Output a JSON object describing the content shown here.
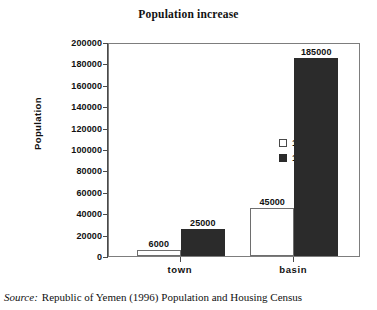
{
  "chart_data": {
    "type": "bar",
    "title": "Population increase",
    "xlabel": "",
    "ylabel": "Population",
    "categories": [
      "town",
      "basin"
    ],
    "series": [
      {
        "name": "1975",
        "values": [
          6000,
          45000
        ],
        "color": "#ffffff"
      },
      {
        "name": "1994",
        "values": [
          25000,
          185000
        ],
        "color": "#2b2b2b"
      }
    ],
    "ylim": [
      0,
      200000
    ],
    "ytick_step": 20000,
    "yticks": [
      "200000",
      "180000",
      "160000",
      "140000",
      "120000",
      "100000",
      "80000",
      "60000",
      "40000",
      "20000",
      "0"
    ],
    "data_labels": {
      "town": {
        "1975": "6000",
        "1994": "25000"
      },
      "basin": {
        "1975": "45000",
        "1994": "185000"
      }
    },
    "grid": false,
    "legend_position": "inside-upper-center"
  },
  "legend": {
    "entries": [
      {
        "label": "1975",
        "swatch": "light-square-icon"
      },
      {
        "label": "1994",
        "swatch": "dark-square-icon"
      }
    ]
  },
  "source": {
    "label": "Source:",
    "text": "Republic of Yemen (1996) Population and Housing Census"
  },
  "colors": {
    "bar_1975": "#ffffff",
    "bar_1994": "#2b2b2b",
    "axis": "#4a4a4a",
    "frame": "#7d7d7d",
    "text": "#111111",
    "background": "#ffffff"
  }
}
